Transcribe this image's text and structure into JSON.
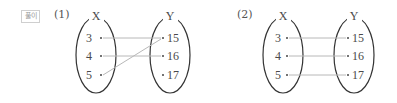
{
  "badge": "풀이",
  "diagrams": [
    {
      "label": "(1)",
      "domain_label": "X",
      "codomain_label": "Y",
      "domain": [
        "3",
        "4",
        "5"
      ],
      "codomain": [
        "15",
        "16",
        "17"
      ],
      "mappings": [
        [
          "3",
          "15"
        ],
        [
          "4",
          "16"
        ],
        [
          "5",
          "15"
        ]
      ]
    },
    {
      "label": "(2)",
      "domain_label": "X",
      "codomain_label": "Y",
      "domain": [
        "3",
        "4",
        "5"
      ],
      "codomain": [
        "15",
        "16",
        "17"
      ],
      "mappings": [
        [
          "3",
          "15"
        ],
        [
          "4",
          "16"
        ],
        [
          "5",
          "17"
        ]
      ]
    }
  ],
  "colors": {
    "ellipse": "#333333",
    "arrow_line": "#b8b8b8",
    "text": "#4a4a4a"
  }
}
